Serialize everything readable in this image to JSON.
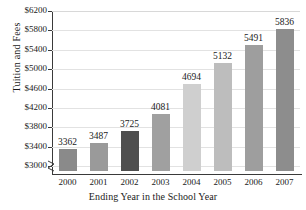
{
  "chart_data": {
    "type": "bar",
    "title": "",
    "xlabel": "Ending Year in the School Year",
    "ylabel": "Tuition and Fees",
    "categories": [
      "2000",
      "2001",
      "2002",
      "2003",
      "2004",
      "2005",
      "2006",
      "2007"
    ],
    "values": [
      3362,
      3487,
      3725,
      4081,
      4694,
      5132,
      5491,
      5836
    ],
    "value_labels": [
      "3362",
      "3487",
      "3725",
      "4081",
      "4694",
      "5132",
      "5491",
      "5836"
    ],
    "ylim": [
      2900,
      6200
    ],
    "ytick_values": [
      3000,
      3400,
      3800,
      4200,
      4600,
      5000,
      5400,
      5800,
      6200
    ],
    "ytick_labels": [
      "$3000",
      "$3400",
      "$3800",
      "$4200",
      "$4600",
      "$5000",
      "$5400",
      "$5800",
      "$6200"
    ],
    "grid": true,
    "legend": "none",
    "axis_break": true,
    "bar_colors": [
      "#8a8a8a",
      "#9a9a9a",
      "#4f4f4f",
      "#a0a0a0",
      "#cfcfcf",
      "#bdbdbd",
      "#9e9e9e",
      "#8d8d8d"
    ]
  }
}
